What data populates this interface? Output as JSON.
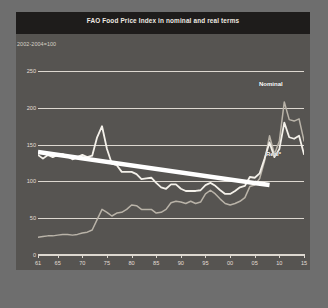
{
  "header": {
    "title": "FAO Food Price Index in nominal and real terms"
  },
  "subtitle": "2002-2004=100",
  "footnote": "* The real price index is the nominal price index deflated by the World Bank Manufactures Unit Value Index (MUV)",
  "labels": {
    "nominal": "Nominal",
    "real": "Real*"
  },
  "colors": {
    "title_band": "#1e1c1b",
    "chart_background": "#565451",
    "page_background": "#6e6e6e",
    "gridline": "#ddd8d0",
    "nominal_line": "#b9b3a8",
    "real_line": "#f4f1ea",
    "trend_line": "#ffffff"
  },
  "chart_data": {
    "type": "line",
    "title": "FAO Food Price Index in nominal and real terms",
    "subtitle": "2002-2004=100",
    "xlabel": "",
    "ylabel": "",
    "xlim": [
      1961,
      2015
    ],
    "ylim": [
      0,
      265
    ],
    "yticks": [
      0,
      50,
      100,
      150,
      200,
      250
    ],
    "ytick_labels": [
      "0",
      "50",
      "100",
      "150",
      "200",
      "250"
    ],
    "xticks": [
      1961,
      1965,
      1970,
      1975,
      1980,
      1985,
      1990,
      1995,
      2000,
      2005,
      2010,
      2015
    ],
    "xtick_labels": [
      "61",
      "65",
      "70",
      "75",
      "80",
      "85",
      "90",
      "95",
      "00",
      "05",
      "10",
      "15"
    ],
    "grid": true,
    "legend": "inline-annotations",
    "x": [
      1961,
      1962,
      1963,
      1964,
      1965,
      1966,
      1967,
      1968,
      1969,
      1970,
      1971,
      1972,
      1973,
      1974,
      1975,
      1976,
      1977,
      1978,
      1979,
      1980,
      1981,
      1982,
      1983,
      1984,
      1985,
      1986,
      1987,
      1988,
      1989,
      1990,
      1991,
      1992,
      1993,
      1994,
      1995,
      1996,
      1997,
      1998,
      1999,
      2000,
      2001,
      2002,
      2003,
      2004,
      2005,
      2006,
      2007,
      2008,
      2009,
      2010,
      2011,
      2012,
      2013,
      2014,
      2015
    ],
    "series": [
      {
        "name": "Nominal",
        "color": "#b9b3a8",
        "values": [
          24,
          25,
          26,
          26,
          27,
          28,
          28,
          27,
          28,
          30,
          31,
          34,
          48,
          62,
          58,
          53,
          57,
          58,
          62,
          68,
          67,
          62,
          62,
          62,
          57,
          58,
          62,
          71,
          73,
          72,
          70,
          73,
          70,
          72,
          83,
          88,
          83,
          76,
          70,
          68,
          70,
          73,
          78,
          93,
          95,
          104,
          128,
          162,
          137,
          155,
          208,
          184,
          182,
          185,
          155
        ]
      },
      {
        "name": "Real*",
        "color": "#f4f1ea",
        "values": [
          136,
          131,
          136,
          133,
          136,
          137,
          134,
          130,
          133,
          136,
          133,
          135,
          160,
          175,
          144,
          124,
          122,
          113,
          113,
          113,
          110,
          103,
          104,
          105,
          98,
          92,
          90,
          96,
          96,
          90,
          87,
          87,
          87,
          88,
          95,
          98,
          94,
          88,
          83,
          83,
          87,
          92,
          94,
          106,
          105,
          111,
          131,
          153,
          133,
          144,
          180,
          160,
          158,
          162,
          137
        ]
      }
    ],
    "trend_line": {
      "name": "trend",
      "color": "#ffffff",
      "x_start": 1961,
      "x_end": 2008,
      "y_start": 140,
      "y_end": 95,
      "style": "thick-straight-overlay"
    }
  }
}
